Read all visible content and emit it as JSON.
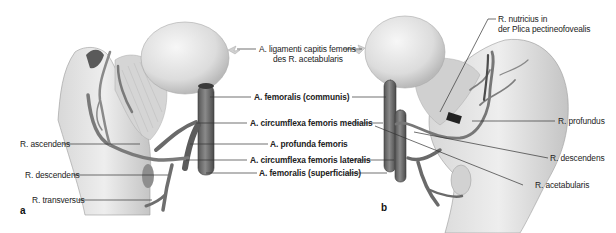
{
  "figure": {
    "panel_a_label": "a",
    "panel_b_label": "b",
    "center_labels": {
      "lig_capitis_line1": "A. ligamenti capitis femoris",
      "lig_capitis_line2": "des R. acetabularis",
      "femoralis_communis": "A. femoralis (communis)",
      "circumflexa_medialis": "A. circumflexa femoris medialis",
      "profunda": "A. profunda femoris",
      "circumflexa_lateralis": "A. circumflexa femoris lateralis",
      "femoralis_superficialis": "A. femoralis (superficialis)"
    },
    "left_labels": {
      "ascendens": "R. ascendens",
      "descendens": "R. descendens",
      "transversus": "R. transversus"
    },
    "right_labels": {
      "nutricius_line1": "R. nutricius in",
      "nutricius_line2": "der Plica pectineofovealis",
      "profundus": "R. profundus",
      "descendens": "R. descendens",
      "acetabularis": "R. acetabularis"
    },
    "colors": {
      "bone": "#e6e6e6",
      "bone_shade": "#bdbdbd",
      "vessel": "#6e6e6e",
      "vessel_dark": "#4a4a4a",
      "leader_line": "#333333"
    }
  }
}
